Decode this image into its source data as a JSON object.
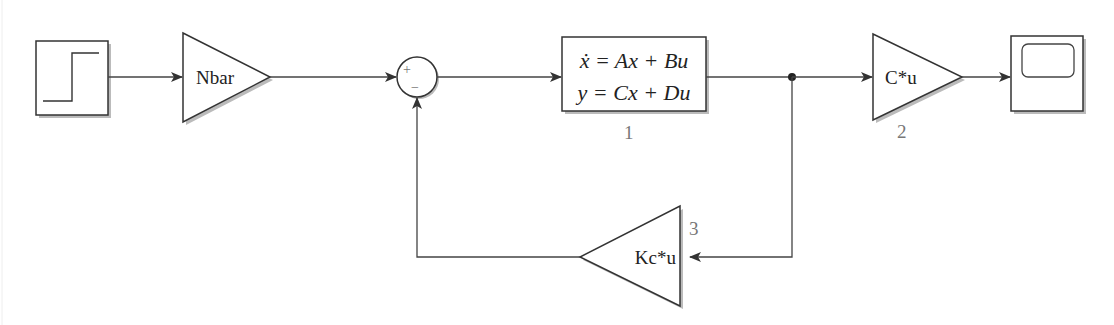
{
  "diagram": {
    "type": "simulink-block-diagram",
    "blocks": {
      "step": {
        "name": "Step",
        "icon": "step-signal-icon"
      },
      "nbar_gain": {
        "label": "Nbar"
      },
      "sum": {
        "plus_sign": "+",
        "minus_sign": "−"
      },
      "state_space": {
        "eq_line1": "ẋ = Ax + Bu",
        "eq_line2": "y = Cx + Du",
        "number": "1"
      },
      "c_gain": {
        "label": "C*u",
        "number": "2"
      },
      "kc_gain": {
        "label": "Kc*u",
        "number": "3"
      },
      "scope": {
        "name": "Scope",
        "icon": "scope-screen-icon"
      }
    },
    "connections": [
      {
        "from": "step",
        "to": "nbar_gain"
      },
      {
        "from": "nbar_gain",
        "to": "sum (+)"
      },
      {
        "from": "sum",
        "to": "state_space"
      },
      {
        "from": "state_space",
        "to": "branch_point"
      },
      {
        "from": "branch_point",
        "to": "c_gain"
      },
      {
        "from": "c_gain",
        "to": "scope"
      },
      {
        "from": "branch_point",
        "to": "kc_gain"
      },
      {
        "from": "kc_gain",
        "to": "sum (−)"
      }
    ],
    "colors": {
      "stroke": "#333333",
      "line": "#444444",
      "label_gray": "#777777",
      "background": "#ffffff"
    }
  }
}
